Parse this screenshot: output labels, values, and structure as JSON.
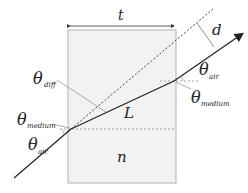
{
  "diagram": {
    "labels": {
      "thickness": "t",
      "displacement": "d",
      "path_length": "L",
      "refractive_index": "n",
      "theta_symbol": "θ",
      "theta_diff_sub": "diff",
      "theta_air_sub": "air",
      "theta_medium_sub": "medium"
    },
    "colors": {
      "slab_fill": "#f2f2f2",
      "slab_border": "#b0b0b0",
      "ray": "#222222",
      "dashed": "#555555"
    }
  }
}
